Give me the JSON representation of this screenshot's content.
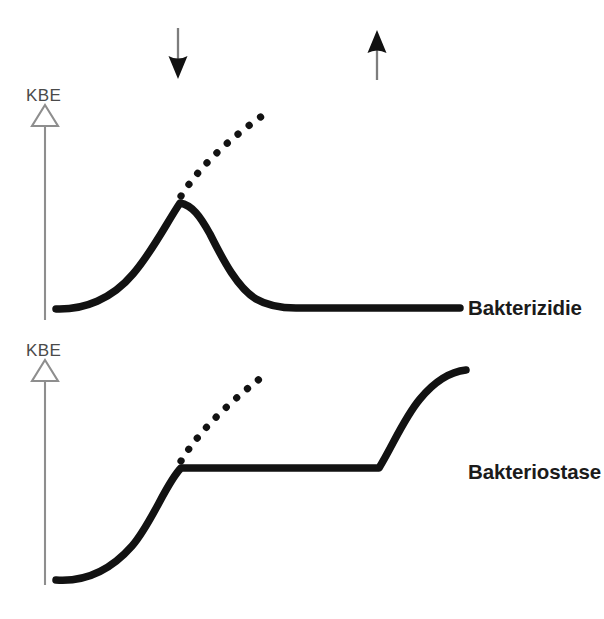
{
  "figure": {
    "background_color": "#ffffff",
    "width": 604,
    "height": 619,
    "caption": "",
    "ink_color": "#121212",
    "axis_color": "#8e8e8e"
  },
  "markers": {
    "antibiotic_added": {
      "name": "arrow-down-marker",
      "direction": "down",
      "x": 178,
      "y_top": 28,
      "y_bottom": 78,
      "meaning": "Antibiotikum zugegeben"
    },
    "antibiotic_removed": {
      "name": "arrow-up-marker",
      "direction": "up",
      "x": 377,
      "y_top": 30,
      "y_bottom": 80,
      "meaning": "Antibiotikum entfernt"
    }
  },
  "panels": [
    {
      "id": "bakterizidie",
      "label": "Bakterizidie",
      "label_x": 468,
      "label_y": 310,
      "axis": {
        "label": "KBE",
        "label_x": 28,
        "label_y": 100,
        "x": 45,
        "y_top": 108,
        "y_bottom": 320
      },
      "solid_curve": {
        "description": "growth then sharp kill-off to a low flat baseline",
        "points": [
          [
            56,
            309
          ],
          [
            80,
            307
          ],
          [
            104,
            299
          ],
          [
            126,
            282
          ],
          [
            148,
            253
          ],
          [
            168,
            222
          ],
          [
            180,
            202
          ],
          [
            192,
            203
          ],
          [
            204,
            212
          ],
          [
            216,
            229
          ],
          [
            228,
            253
          ],
          [
            240,
            277
          ],
          [
            252,
            294
          ],
          [
            264,
            303
          ],
          [
            276,
            307
          ],
          [
            292,
            308
          ],
          [
            460,
            308
          ]
        ]
      },
      "dotted_curve": {
        "description": "untreated control continues to grow",
        "points": [
          [
            181,
            196
          ],
          [
            190,
            180
          ],
          [
            200,
            166
          ],
          [
            211,
            152
          ],
          [
            223,
            140
          ],
          [
            236,
            130
          ],
          [
            249,
            122
          ],
          [
            262,
            116
          ]
        ]
      }
    },
    {
      "id": "bakteriostase",
      "label": "Bakteriostase",
      "label_x": 468,
      "label_y": 473,
      "axis": {
        "label": "KBE",
        "label_x": 28,
        "label_y": 355,
        "x": 45,
        "y_top": 363,
        "y_bottom": 585
      },
      "solid_curve": {
        "description": "growth, plateau while antibiotic present, then regrowth after removal",
        "points": [
          [
            56,
            580
          ],
          [
            76,
            578
          ],
          [
            96,
            570
          ],
          [
            116,
            554
          ],
          [
            136,
            530
          ],
          [
            156,
            500
          ],
          [
            170,
            478
          ],
          [
            181,
            468
          ],
          [
            196,
            468
          ],
          [
            280,
            468
          ],
          [
            360,
            468
          ],
          [
            379,
            468
          ],
          [
            392,
            448
          ],
          [
            404,
            424
          ],
          [
            416,
            402
          ],
          [
            428,
            387
          ],
          [
            440,
            377
          ],
          [
            452,
            372
          ],
          [
            466,
            370
          ]
        ]
      },
      "dotted_curve": {
        "description": "untreated control continues to grow",
        "points": [
          [
            181,
            461
          ],
          [
            190,
            444
          ],
          [
            200,
            428
          ],
          [
            211,
            414
          ],
          [
            223,
            401
          ],
          [
            236,
            391
          ],
          [
            249,
            383
          ],
          [
            262,
            377
          ]
        ]
      }
    }
  ]
}
